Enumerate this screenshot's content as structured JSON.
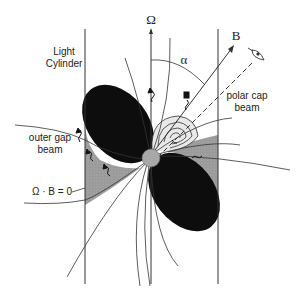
{
  "diagram": {
    "labels": {
      "omega_axis": "Ω",
      "magnetic_axis": "B",
      "inclination_angle": "α",
      "light_cylinder_line1": "Light",
      "light_cylinder_line2": "Cylinder",
      "outer_gap_line1": "outer gap",
      "outer_gap_line2": "beam",
      "polar_cap_line1": "polar cap",
      "polar_cap_line2": "beam",
      "null_surface": "Ω · B = 0"
    },
    "icons": {
      "observer": "eye-icon",
      "photon": "wavy-arrow-icon"
    },
    "colors": {
      "lobe": "#0d0d0d",
      "gap_region": "#9a9a9a",
      "star": "#a8a8a8",
      "line": "#333333",
      "background": "#ffffff"
    }
  }
}
